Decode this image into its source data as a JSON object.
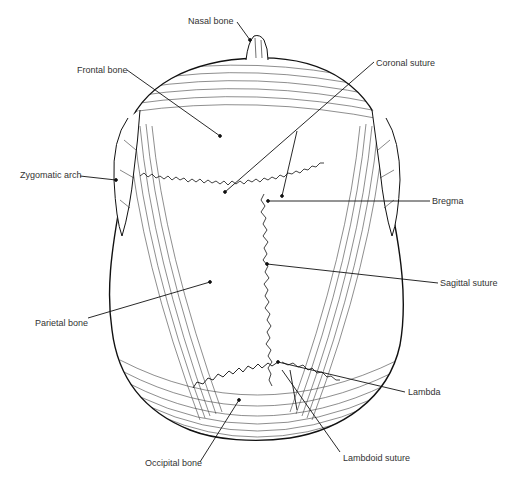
{
  "figure": {
    "colors": {
      "ink": "#111111",
      "label_text": "#333333",
      "background": "#ffffff"
    },
    "labels": [
      {
        "id": "nasal-bone",
        "text": "Nasal bone",
        "x": 188,
        "y": 16
      },
      {
        "id": "frontal-bone",
        "text": "Frontal bone",
        "x": 77,
        "y": 65
      },
      {
        "id": "coronal-suture",
        "text": "Coronal suture",
        "x": 376,
        "y": 58
      },
      {
        "id": "zygomatic-arch",
        "text": "Zygomatic arch",
        "x": 20,
        "y": 170
      },
      {
        "id": "bregma",
        "text": "Bregma",
        "x": 432,
        "y": 196
      },
      {
        "id": "sagittal-suture",
        "text": "Sagittal suture",
        "x": 440,
        "y": 278
      },
      {
        "id": "parietal-bone",
        "text": "Parietal bone",
        "x": 35,
        "y": 318
      },
      {
        "id": "lambda",
        "text": "Lambda",
        "x": 408,
        "y": 387
      },
      {
        "id": "occipital-bone",
        "text": "Occipital bone",
        "x": 145,
        "y": 458
      },
      {
        "id": "lambdoid-suture",
        "text": "Lambdoid suture",
        "x": 343,
        "y": 453
      }
    ]
  }
}
